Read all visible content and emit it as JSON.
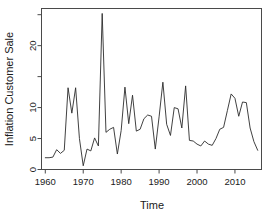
{
  "chart_data": {
    "type": "line",
    "title": "",
    "xlabel": "Time",
    "ylabel": "Inflation Customer Sale",
    "xlim": [
      1959,
      2017
    ],
    "ylim": [
      0,
      26
    ],
    "xticks": [
      1960,
      1970,
      1980,
      1990,
      2000,
      2010
    ],
    "xticklabels": [
      "1960",
      "1970",
      "1980",
      "1990",
      "2000",
      "2010"
    ],
    "yticks": [
      0,
      5,
      10,
      15,
      20,
      25
    ],
    "yticklabels": [
      "0",
      "5",
      "10",
      "",
      "20",
      ""
    ],
    "grid": false,
    "legend": null,
    "series": [
      {
        "name": "Inflation Customer Sale",
        "x": [
          1960,
          1961,
          1962,
          1963,
          1964,
          1965,
          1966,
          1967,
          1968,
          1969,
          1970,
          1971,
          1972,
          1973,
          1974,
          1975,
          1976,
          1977,
          1978,
          1979,
          1980,
          1981,
          1982,
          1983,
          1984,
          1985,
          1986,
          1987,
          1988,
          1989,
          1990,
          1991,
          1992,
          1993,
          1994,
          1995,
          1996,
          1997,
          1998,
          1999,
          2000,
          2001,
          2002,
          2003,
          2004,
          2005,
          2006,
          2007,
          2008,
          2009,
          2010,
          2011,
          2012,
          2013,
          2014,
          2015,
          2016
        ],
        "values": [
          1.9,
          1.9,
          2.0,
          3.2,
          2.6,
          3.1,
          13.2,
          9.1,
          13.2,
          5.0,
          0.6,
          3.3,
          3.0,
          5.1,
          3.8,
          25.2,
          6.0,
          6.5,
          6.8,
          2.5,
          6.3,
          13.3,
          7.4,
          12.0,
          6.2,
          6.5,
          8.2,
          8.8,
          8.6,
          3.3,
          8.5,
          14.1,
          7.3,
          5.5,
          10.0,
          9.8,
          6.7,
          13.5,
          4.7,
          4.6,
          4.1,
          3.8,
          4.6,
          4.1,
          3.9,
          5.0,
          6.5,
          6.8,
          9.5,
          12.2,
          11.5,
          8.6,
          10.9,
          10.8,
          6.7,
          4.5,
          3.1
        ]
      }
    ]
  },
  "axes": {
    "x_title": "Time",
    "y_title": "Inflation Customer Sale"
  }
}
